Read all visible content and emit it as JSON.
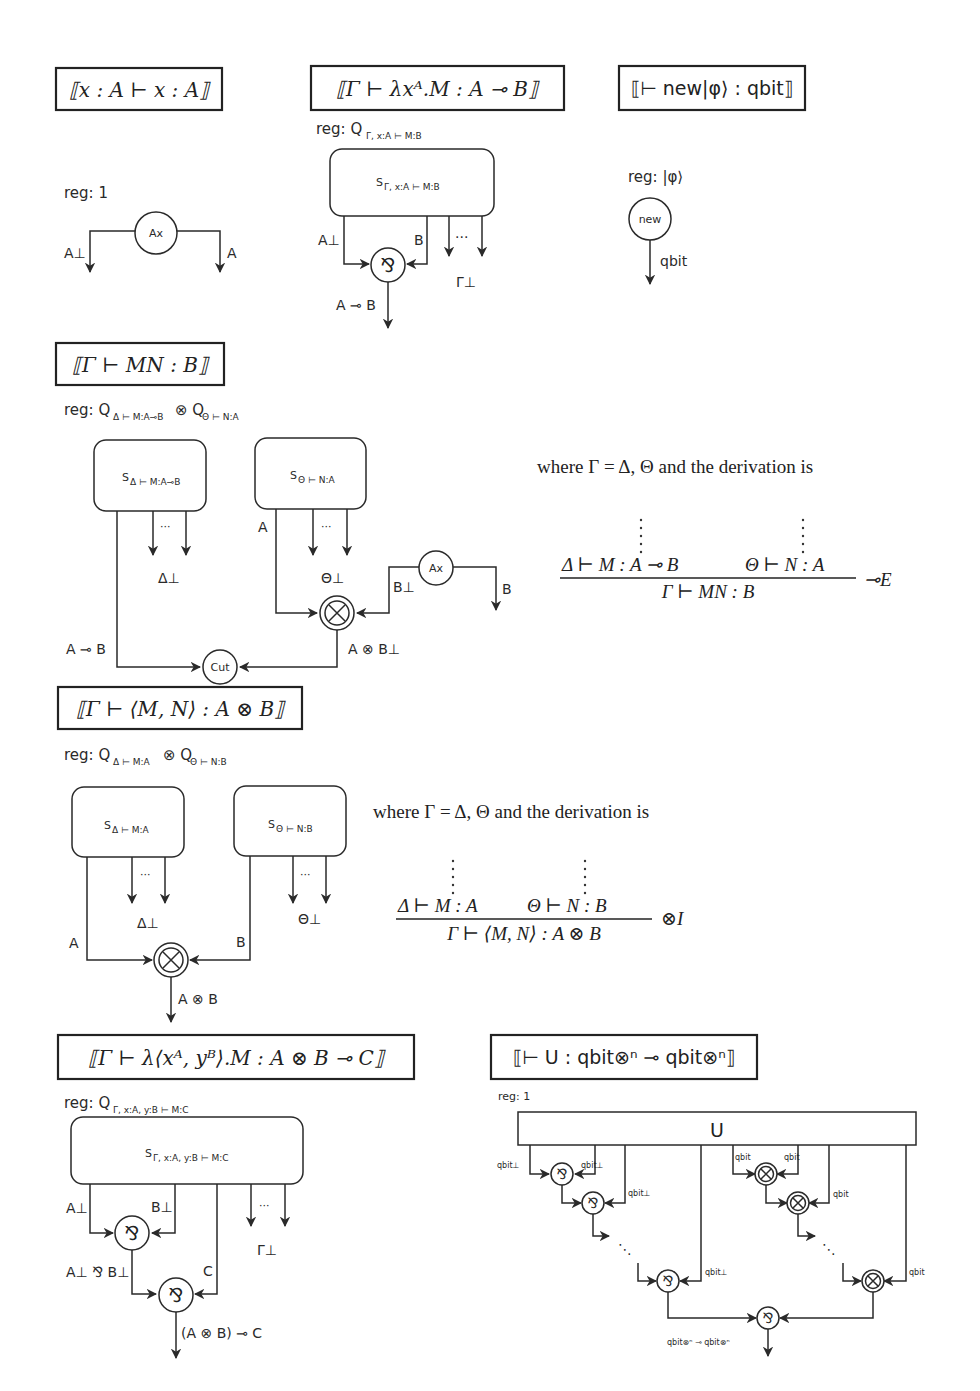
{
  "panels": {
    "axiom": {
      "title": "⟦x : A ⊢ x : A⟧",
      "reg": "reg: 1",
      "node": "Ax",
      "left_wire": "A⊥",
      "right_wire": "A"
    },
    "lambda": {
      "title": "⟦Γ ⊢ λxᴬ.M : A ⊸ B⟧",
      "reg_prefix": "reg: Q",
      "reg_sub": "Γ, x:A ⊢ M:B",
      "box_main": "S",
      "box_sub": "Γ, x:A ⊢ M:B",
      "wire_a": "A⊥",
      "wire_b": "B",
      "dots": "···",
      "gamma": "Γ⊥",
      "node": "⅋",
      "output": "A ⊸ B"
    },
    "new": {
      "title": "⟦⊢ new|φ⟩ : qbit⟧",
      "reg": "reg: |φ⟩",
      "node": "new",
      "output": "qbit"
    },
    "application": {
      "title": "⟦Γ ⊢ MN : B⟧",
      "reg_prefix": "reg: Q",
      "reg_sub1": "Δ ⊢ M:A⊸B",
      "reg_tensor": "⊗ Q",
      "reg_sub2": "Θ ⊢ N:A",
      "box1_main": "S",
      "box1_sub": "Δ ⊢ M:A⊸B",
      "box2_main": "S",
      "box2_sub": "Θ ⊢ N:A",
      "dots": "···",
      "delta": "Δ⊥",
      "theta": "Θ⊥",
      "wire_a": "A",
      "ax_node": "Ax",
      "wire_b_perp": "B⊥",
      "wire_b": "B",
      "tensor_node": "⊗",
      "wire_lolli": "A ⊸ B",
      "wire_tensor": "A ⊗ B⊥",
      "cut_node": "Cut",
      "prose": "where Γ = Δ, Θ and the derivation is",
      "premise_left": "Δ ⊢ M : A ⊸ B",
      "premise_right": "Θ ⊢ N : A",
      "conclusion": "Γ ⊢ MN : B",
      "rule": "⊸E"
    },
    "pair": {
      "title": "⟦Γ ⊢ ⟨M, N⟩ : A ⊗ B⟧",
      "reg_prefix": "reg: Q",
      "reg_sub1": "Δ ⊢ M:A",
      "reg_tensor": "⊗ Q",
      "reg_sub2": "Θ ⊢ N:B",
      "box1_main": "S",
      "box1_sub": "Δ ⊢ M:A",
      "box2_main": "S",
      "box2_sub": "Θ ⊢ N:B",
      "dots": "···",
      "delta": "Δ⊥",
      "theta": "Θ⊥",
      "wire_a": "A",
      "wire_b": "B",
      "tensor_node": "⊗",
      "output": "A ⊗ B",
      "prose": "where Γ = Δ, Θ and the derivation is",
      "premise_left": "Δ ⊢ M : A",
      "premise_right": "Θ ⊢ N : B",
      "conclusion": "Γ ⊢ ⟨M, N⟩ : A ⊗ B",
      "rule": "⊗I"
    },
    "pair_lambda": {
      "title": "⟦Γ ⊢ λ⟨xᴬ, yᴮ⟩.M : A ⊗ B ⊸ C⟧",
      "reg_prefix": "reg: Q",
      "reg_sub": "Γ, x:A, y:B ⊢ M:C",
      "box_main": "S",
      "box_sub": "Γ, x:A, y:B ⊢ M:C",
      "wire_a": "A⊥",
      "wire_b": "B⊥",
      "wire_c": "C",
      "dots": "···",
      "gamma": "Γ⊥",
      "node1": "⅋",
      "node2": "⅋",
      "wire_par": "A⊥ ⅋ B⊥",
      "output": "(A ⊗ B) ⊸ C"
    },
    "unitary": {
      "title": "⟦⊢ U : qbit⊗ⁿ ⊸ qbit⊗ⁿ⟧",
      "reg": "reg: 1",
      "box": "U",
      "qbit_perp": "qbit⊥",
      "qbit": "qbit",
      "par_node": "⅋",
      "tensor_node": "⊗",
      "ellipsis": "⋱",
      "output": "qbit⊗ⁿ ⊸ qbit⊗ⁿ"
    }
  }
}
